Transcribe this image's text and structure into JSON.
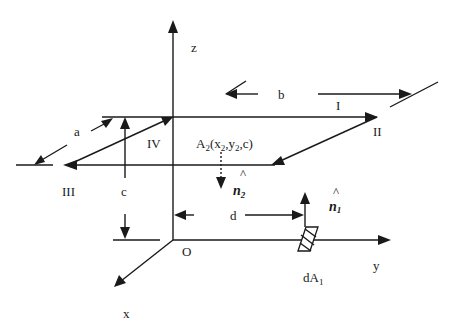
{
  "diagram": {
    "axes": {
      "z_label": "z",
      "y_label": "y",
      "x_label": "x",
      "origin_label": "O"
    },
    "plate": {
      "label_main": "A",
      "label_sub": "2",
      "label_coords": "(x",
      "label_coords_sub1": "2",
      "label_coords_mid": ",y",
      "label_coords_sub2": "2",
      "label_coords_end": ",c)",
      "edges": [
        "I",
        "II",
        "III",
        "IV"
      ]
    },
    "dimensions": {
      "a": "a",
      "b": "b",
      "c": "c",
      "d": "d"
    },
    "normals": {
      "n1": "n",
      "n1_sub": "1",
      "n2": "n",
      "n2_sub": "2",
      "hat": "^"
    },
    "element": {
      "label_main": "dA",
      "label_sub": "1"
    },
    "colors": {
      "ink": "#1a1a1a",
      "background": "#ffffff"
    }
  }
}
